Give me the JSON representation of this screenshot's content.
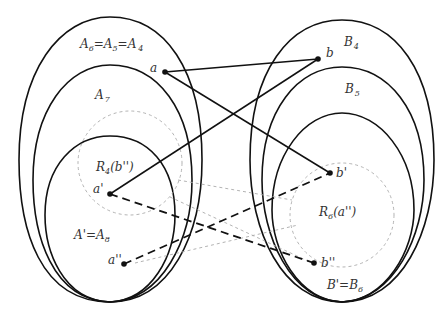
{
  "diagram": {
    "colors": {
      "stroke": "#111111",
      "dashed_region": "#aaaaaa",
      "background": "#ffffff"
    },
    "left_family": {
      "outer_label": {
        "base": "A",
        "parts": [
          [
            "A",
            "6"
          ],
          [
            "A",
            "5"
          ],
          [
            "A",
            "4"
          ]
        ],
        "text": "A6=A5=A4"
      },
      "middle_label": {
        "base": "A",
        "sub": "7",
        "text": "A7"
      },
      "inner_label": {
        "text": "A'=A8",
        "prefix": "A'=A",
        "sub": "8"
      },
      "region_label": {
        "prefix": "R",
        "sub": "4",
        "suffix": "(b'')",
        "text": "R4(b'')"
      }
    },
    "right_family": {
      "outer_label": {
        "base": "B",
        "sub": "4",
        "text": "B4"
      },
      "middle_label": {
        "base": "B",
        "sub": "5",
        "text": "B5"
      },
      "inner_label": {
        "text": "B'=B6",
        "prefix": "B'=B",
        "sub": "6"
      },
      "region_label": {
        "prefix": "R",
        "sub": "6",
        "suffix": "(a'')",
        "text": "R6(a'')"
      }
    },
    "points": {
      "a": {
        "label": "a",
        "x": 165,
        "y": 72
      },
      "b": {
        "label": "b",
        "x": 318,
        "y": 59
      },
      "a_prime": {
        "label": "a'",
        "x": 110,
        "y": 194
      },
      "a_dprime": {
        "label": "a''",
        "x": 124,
        "y": 264
      },
      "b_prime": {
        "label": "b'",
        "x": 330,
        "y": 173
      },
      "b_dprime": {
        "label": "b''",
        "x": 314,
        "y": 263
      }
    },
    "edges": [
      {
        "from": "a",
        "to": "b",
        "style": "solid"
      },
      {
        "from": "a",
        "to": "b_prime",
        "style": "solid"
      },
      {
        "from": "a_prime",
        "to": "b",
        "style": "solid"
      },
      {
        "from": "a_prime",
        "to": "b_dprime",
        "style": "dashed"
      },
      {
        "from": "a_dprime",
        "to": "b_prime",
        "style": "dashed"
      }
    ]
  }
}
